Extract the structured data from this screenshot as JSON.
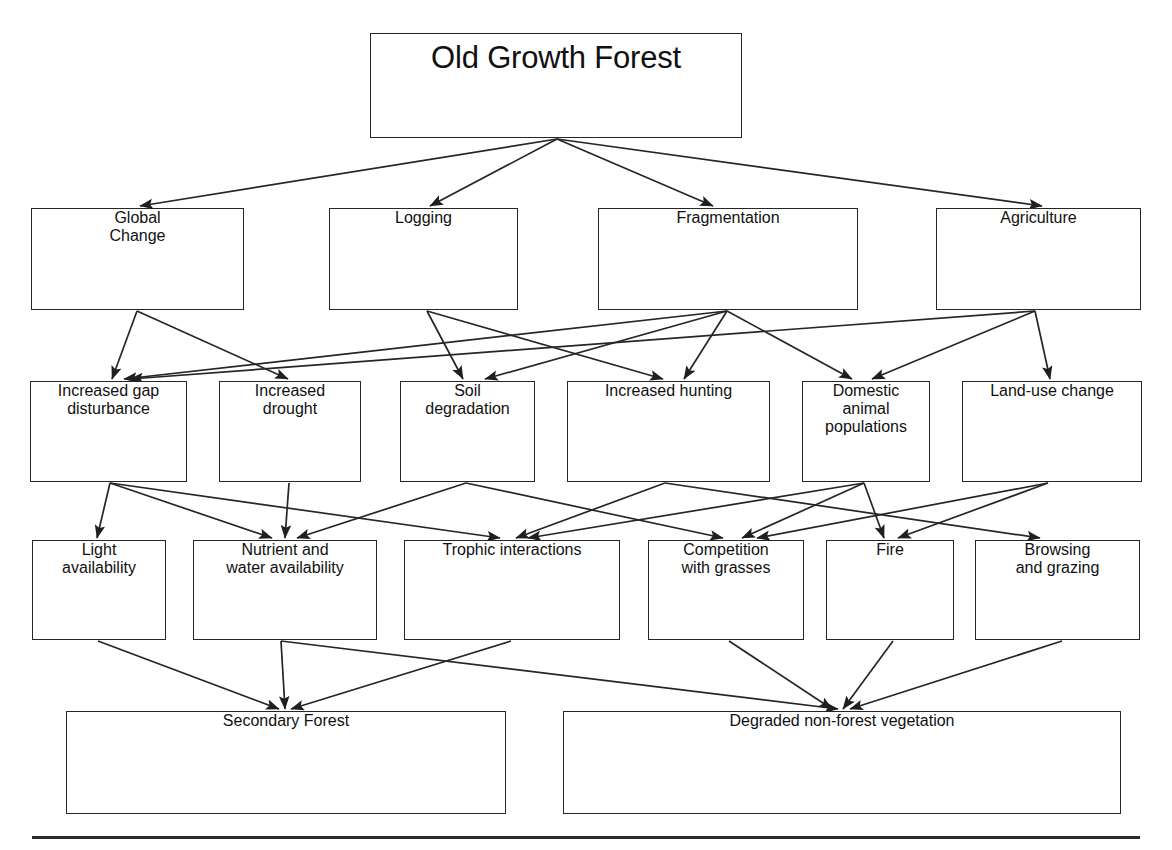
{
  "diagram": {
    "type": "flow-diagram",
    "line_color": "#262626",
    "box_fill": "#ffffff",
    "footer_rule": true,
    "tiers": [
      {
        "id": "root",
        "label_role": "source-state"
      },
      {
        "id": "drivers",
        "label_role": "drivers"
      },
      {
        "id": "processes",
        "label_role": "proximate-processes"
      },
      {
        "id": "mechanisms",
        "label_role": "ecological-mechanisms"
      },
      {
        "id": "outcomes",
        "label_role": "end-states"
      }
    ],
    "nodes": [
      {
        "id": "old-growth-forest",
        "label": "Old Growth Forest",
        "tier": "root",
        "x": 370,
        "y": 33,
        "w": 372,
        "h": 105
      },
      {
        "id": "global-change",
        "label": "Global\nChange",
        "tier": "drivers",
        "x": 31,
        "y": 208,
        "w": 213,
        "h": 102
      },
      {
        "id": "logging",
        "label": "Logging",
        "tier": "drivers",
        "x": 329,
        "y": 208,
        "w": 189,
        "h": 102
      },
      {
        "id": "fragmentation",
        "label": "Fragmentation",
        "tier": "drivers",
        "x": 598,
        "y": 208,
        "w": 260,
        "h": 102
      },
      {
        "id": "agriculture",
        "label": "Agriculture",
        "tier": "drivers",
        "x": 936,
        "y": 208,
        "w": 205,
        "h": 102
      },
      {
        "id": "increased-gap-disturbance",
        "label": "Increased gap\ndisturbance",
        "tier": "processes",
        "x": 30,
        "y": 381,
        "w": 157,
        "h": 101
      },
      {
        "id": "increased-drought",
        "label": "Increased\ndrought",
        "tier": "processes",
        "x": 219,
        "y": 381,
        "w": 142,
        "h": 101
      },
      {
        "id": "soil-degradation",
        "label": "Soil\ndegradation",
        "tier": "processes",
        "x": 400,
        "y": 381,
        "w": 135,
        "h": 101
      },
      {
        "id": "increased-hunting",
        "label": "Increased hunting",
        "tier": "processes",
        "x": 567,
        "y": 381,
        "w": 203,
        "h": 101
      },
      {
        "id": "domestic-animal-populations",
        "label": "Domestic\nanimal\npopulations",
        "tier": "processes",
        "x": 802,
        "y": 381,
        "w": 128,
        "h": 101
      },
      {
        "id": "land-use-change",
        "label": "Land-use change",
        "tier": "processes",
        "x": 962,
        "y": 381,
        "w": 180,
        "h": 101
      },
      {
        "id": "light-availability",
        "label": "Light\navailability",
        "tier": "mechanisms",
        "x": 32,
        "y": 540,
        "w": 134,
        "h": 100
      },
      {
        "id": "nutrient-water-availability",
        "label": "Nutrient and\nwater availability",
        "tier": "mechanisms",
        "x": 193,
        "y": 540,
        "w": 184,
        "h": 100
      },
      {
        "id": "trophic-interactions",
        "label": "Trophic interactions",
        "tier": "mechanisms",
        "x": 404,
        "y": 540,
        "w": 216,
        "h": 100
      },
      {
        "id": "competition-with-grasses",
        "label": "Competition\nwith grasses",
        "tier": "mechanisms",
        "x": 648,
        "y": 540,
        "w": 156,
        "h": 100
      },
      {
        "id": "fire",
        "label": "Fire",
        "tier": "mechanisms",
        "x": 826,
        "y": 540,
        "w": 128,
        "h": 100
      },
      {
        "id": "browsing-and-grazing",
        "label": "Browsing\nand grazing",
        "tier": "mechanisms",
        "x": 975,
        "y": 540,
        "w": 165,
        "h": 100
      },
      {
        "id": "secondary-forest",
        "label": "Secondary Forest",
        "tier": "outcomes",
        "x": 66,
        "y": 711,
        "w": 440,
        "h": 103
      },
      {
        "id": "degraded-non-forest-vegetation",
        "label": "Degraded non-forest vegetation",
        "tier": "outcomes",
        "x": 563,
        "y": 711,
        "w": 558,
        "h": 103
      }
    ],
    "edges": [
      {
        "from": "old-growth-forest",
        "to": "global-change",
        "x1": 557,
        "y1": 139,
        "x2": 140,
        "y2": 206
      },
      {
        "from": "old-growth-forest",
        "to": "logging",
        "x1": 557,
        "y1": 139,
        "x2": 430,
        "y2": 206
      },
      {
        "from": "old-growth-forest",
        "to": "fragmentation",
        "x1": 557,
        "y1": 139,
        "x2": 713,
        "y2": 206
      },
      {
        "from": "old-growth-forest",
        "to": "agriculture",
        "x1": 557,
        "y1": 139,
        "x2": 1042,
        "y2": 206
      },
      {
        "from": "global-change",
        "to": "increased-gap-disturbance",
        "x1": 137,
        "y1": 311,
        "x2": 112,
        "y2": 379
      },
      {
        "from": "global-change",
        "to": "increased-drought",
        "x1": 137,
        "y1": 311,
        "x2": 288,
        "y2": 379
      },
      {
        "from": "logging",
        "to": "soil-degradation",
        "x1": 427,
        "y1": 311,
        "x2": 463,
        "y2": 379
      },
      {
        "from": "logging",
        "to": "increased-hunting",
        "x1": 427,
        "y1": 311,
        "x2": 663,
        "y2": 379
      },
      {
        "from": "fragmentation",
        "to": "increased-hunting",
        "x1": 727,
        "y1": 311,
        "x2": 684,
        "y2": 379
      },
      {
        "from": "fragmentation",
        "to": "soil-degradation",
        "x1": 727,
        "y1": 311,
        "x2": 485,
        "y2": 379
      },
      {
        "from": "fragmentation",
        "to": "increased-gap-disturbance",
        "x1": 727,
        "y1": 311,
        "x2": 124,
        "y2": 379
      },
      {
        "from": "agriculture",
        "to": "land-use-change",
        "x1": 1035,
        "y1": 311,
        "x2": 1050,
        "y2": 379
      },
      {
        "from": "agriculture",
        "to": "domestic-animal-populations",
        "x1": 1035,
        "y1": 311,
        "x2": 872,
        "y2": 379
      },
      {
        "from": "agriculture",
        "to": "increased-gap-disturbance",
        "x1": 1035,
        "y1": 311,
        "x2": 130,
        "y2": 379
      },
      {
        "from": "fragmentation",
        "to": "domestic-animal-populations",
        "x1": 727,
        "y1": 311,
        "x2": 852,
        "y2": 379
      },
      {
        "from": "increased-gap-disturbance",
        "to": "light-availability",
        "x1": 110,
        "y1": 483,
        "x2": 97,
        "y2": 538
      },
      {
        "from": "increased-gap-disturbance",
        "to": "nutrient-water-availability",
        "x1": 110,
        "y1": 483,
        "x2": 272,
        "y2": 538
      },
      {
        "from": "increased-gap-disturbance",
        "to": "trophic-interactions",
        "x1": 110,
        "y1": 483,
        "x2": 500,
        "y2": 538
      },
      {
        "from": "increased-drought",
        "to": "nutrient-water-availability",
        "x1": 289,
        "y1": 483,
        "x2": 285,
        "y2": 538
      },
      {
        "from": "soil-degradation",
        "to": "nutrient-water-availability",
        "x1": 466,
        "y1": 483,
        "x2": 297,
        "y2": 538
      },
      {
        "from": "soil-degradation",
        "to": "competition-with-grasses",
        "x1": 466,
        "y1": 483,
        "x2": 723,
        "y2": 538
      },
      {
        "from": "increased-hunting",
        "to": "trophic-interactions",
        "x1": 665,
        "y1": 483,
        "x2": 516,
        "y2": 538
      },
      {
        "from": "increased-hunting",
        "to": "browsing-and-grazing",
        "x1": 665,
        "y1": 483,
        "x2": 1040,
        "y2": 538
      },
      {
        "from": "domestic-animal-populations",
        "to": "trophic-interactions",
        "x1": 864,
        "y1": 483,
        "x2": 528,
        "y2": 538
      },
      {
        "from": "domestic-animal-populations",
        "to": "competition-with-grasses",
        "x1": 864,
        "y1": 483,
        "x2": 742,
        "y2": 538
      },
      {
        "from": "domestic-animal-populations",
        "to": "fire",
        "x1": 864,
        "y1": 483,
        "x2": 884,
        "y2": 538
      },
      {
        "from": "land-use-change",
        "to": "fire",
        "x1": 1048,
        "y1": 483,
        "x2": 898,
        "y2": 538
      },
      {
        "from": "land-use-change",
        "to": "competition-with-grasses",
        "x1": 1048,
        "y1": 483,
        "x2": 757,
        "y2": 538
      },
      {
        "from": "light-availability",
        "to": "secondary-forest",
        "x1": 98,
        "y1": 641,
        "x2": 279,
        "y2": 709
      },
      {
        "from": "nutrient-water-availability",
        "to": "secondary-forest",
        "x1": 281,
        "y1": 641,
        "x2": 285,
        "y2": 709
      },
      {
        "from": "nutrient-water-availability",
        "to": "degraded-non-forest-vegetation",
        "x1": 281,
        "y1": 641,
        "x2": 838,
        "y2": 709
      },
      {
        "from": "trophic-interactions",
        "to": "secondary-forest",
        "x1": 511,
        "y1": 641,
        "x2": 291,
        "y2": 709
      },
      {
        "from": "competition-with-grasses",
        "to": "degraded-non-forest-vegetation",
        "x1": 729,
        "y1": 641,
        "x2": 832,
        "y2": 709
      },
      {
        "from": "fire",
        "to": "degraded-non-forest-vegetation",
        "x1": 893,
        "y1": 641,
        "x2": 843,
        "y2": 709
      },
      {
        "from": "browsing-and-grazing",
        "to": "degraded-non-forest-vegetation",
        "x1": 1062,
        "y1": 641,
        "x2": 850,
        "y2": 709
      }
    ]
  }
}
